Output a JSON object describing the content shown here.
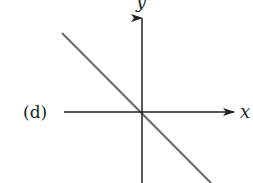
{
  "figure": {
    "panel_label": "(d)",
    "x_axis_label": "x",
    "y_axis_label": "y",
    "line_description": "straight line with negative slope passing through the origin",
    "colors": {
      "axes": "#222222",
      "line": "#6e6e6e",
      "background": "#ffffff"
    }
  }
}
